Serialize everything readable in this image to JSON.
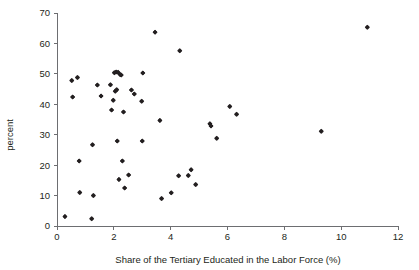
{
  "figure": {
    "background_color": "#ffffff",
    "marker_color": "#231f20",
    "axis_color": "#6d6e71",
    "cropped_title_fragment": ""
  },
  "chart_data": {
    "type": "scatter",
    "title": "",
    "xlabel": "Share of the Tertiary Educated in the Labor Force (%)",
    "ylabel": "percent",
    "xlim": [
      0,
      12
    ],
    "ylim": [
      0,
      70
    ],
    "xticks": [
      0,
      2,
      4,
      6,
      8,
      10,
      12
    ],
    "yticks": [
      0,
      10,
      20,
      30,
      40,
      50,
      60,
      70
    ],
    "xtick_labels": [
      "0",
      "2",
      "4",
      "6",
      "8",
      "10",
      "12"
    ],
    "ytick_labels": [
      "0",
      "10",
      "20",
      "30",
      "40",
      "50",
      "60",
      "70"
    ],
    "grid": false,
    "legend": null,
    "marker": "diamond",
    "series": [
      {
        "name": "countries",
        "points": [
          [
            0.28,
            3.1
          ],
          [
            0.52,
            47.8
          ],
          [
            0.55,
            42.4
          ],
          [
            0.72,
            48.8
          ],
          [
            0.78,
            21.4
          ],
          [
            0.8,
            11.0
          ],
          [
            1.22,
            2.4
          ],
          [
            1.25,
            26.7
          ],
          [
            1.28,
            10.0
          ],
          [
            1.42,
            46.3
          ],
          [
            1.55,
            42.7
          ],
          [
            1.88,
            46.4
          ],
          [
            1.92,
            38.1
          ],
          [
            1.98,
            41.3
          ],
          [
            2.02,
            50.4
          ],
          [
            2.05,
            44.3
          ],
          [
            2.08,
            50.6
          ],
          [
            2.1,
            44.8
          ],
          [
            2.12,
            27.9
          ],
          [
            2.15,
            50.5
          ],
          [
            2.18,
            15.3
          ],
          [
            2.22,
            49.8
          ],
          [
            2.26,
            49.6
          ],
          [
            2.3,
            21.4
          ],
          [
            2.34,
            37.5
          ],
          [
            2.38,
            12.5
          ],
          [
            2.52,
            16.8
          ],
          [
            2.62,
            44.7
          ],
          [
            2.72,
            43.4
          ],
          [
            2.98,
            41.0
          ],
          [
            3.0,
            27.9
          ],
          [
            3.02,
            50.3
          ],
          [
            3.45,
            63.7
          ],
          [
            3.62,
            34.7
          ],
          [
            3.68,
            9.0
          ],
          [
            4.02,
            10.9
          ],
          [
            4.28,
            16.5
          ],
          [
            4.32,
            57.6
          ],
          [
            4.62,
            16.6
          ],
          [
            4.72,
            18.5
          ],
          [
            4.88,
            13.6
          ],
          [
            5.38,
            33.6
          ],
          [
            5.42,
            32.9
          ],
          [
            5.62,
            28.8
          ],
          [
            6.08,
            39.3
          ],
          [
            6.32,
            36.7
          ],
          [
            9.3,
            31.1
          ],
          [
            10.92,
            65.3
          ]
        ]
      }
    ],
    "point_count": 48
  },
  "axes": {
    "x_axis_name": "x-axis",
    "y_axis_name": "y-axis"
  }
}
